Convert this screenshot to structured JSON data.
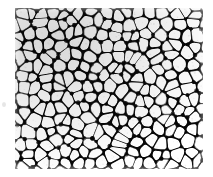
{
  "figure": {
    "kind": "micrograph",
    "canvas": {
      "width": 213,
      "height": 177
    },
    "background_color": "#ffffff"
  },
  "panel": {
    "x": 15,
    "y": 8,
    "width": 188,
    "height": 161,
    "interior_color": "#ffffff"
  },
  "palette": {
    "background": "#ffffff",
    "cell_interior": "#ffffff",
    "wall_light": "#9a9a9a",
    "wall_mid": "#6b6b6b",
    "wall_dark": "#3a3a3a",
    "node_darkest": "#1a1a1a",
    "grain": "#707070",
    "speck": "#d8d8d8"
  },
  "texture": {
    "type": "voronoi-cell-network",
    "cell_count": 286,
    "mean_cell_diameter_px": 12.5,
    "cell_diameter_range_px": [
      7,
      18
    ],
    "wall_thickness_range_px": [
      0.7,
      2.6
    ],
    "blur_px": 0.35,
    "seed": 20517,
    "columns": 16,
    "rows": 15,
    "jitter": 0.44,
    "vertical_elongation": 1.12
  },
  "artifacts": {
    "margin_speck": {
      "x": 2,
      "y": 102,
      "width": 4,
      "height": 5,
      "color": "#dcdcdc",
      "opacity": 0.7
    }
  },
  "grain": {
    "dot_count": 900,
    "dot_radius_range_px": [
      0.3,
      0.9
    ],
    "opacity": 0.16
  },
  "density": {
    "gradient_focus": "upper-left",
    "focus_x_pct": 22,
    "focus_y_pct": 18,
    "peak_opacity": 0.16
  }
}
